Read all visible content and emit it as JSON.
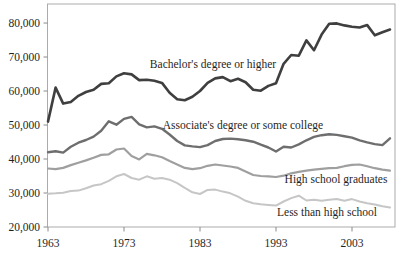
{
  "chart_data": {
    "type": "line",
    "title": "",
    "xlabel": "",
    "ylabel": "",
    "grid": false,
    "legend_position": "inline-labels",
    "x_start": 1963,
    "x_end": 2008,
    "x": [
      1963,
      1964,
      1965,
      1966,
      1967,
      1968,
      1969,
      1970,
      1971,
      1972,
      1973,
      1974,
      1975,
      1976,
      1977,
      1978,
      1979,
      1980,
      1981,
      1982,
      1983,
      1984,
      1985,
      1986,
      1987,
      1988,
      1989,
      1990,
      1991,
      1992,
      1993,
      1994,
      1995,
      1996,
      1997,
      1998,
      1999,
      2000,
      2001,
      2002,
      2003,
      2004,
      2005,
      2006,
      2007,
      2008
    ],
    "xticks": [
      {
        "v": 1963,
        "label": "1963"
      },
      {
        "v": 1973,
        "label": "1973"
      },
      {
        "v": 1983,
        "label": "1983"
      },
      {
        "v": 1993,
        "label": "1993"
      },
      {
        "v": 2003,
        "label": "2003"
      }
    ],
    "yticks": [
      {
        "v": 20000,
        "label": "20,000"
      },
      {
        "v": 30000,
        "label": "30,000"
      },
      {
        "v": 40000,
        "label": "40,000"
      },
      {
        "v": 50000,
        "label": "50,000"
      },
      {
        "v": 60000,
        "label": "60,000"
      },
      {
        "v": 70000,
        "label": "70,000"
      },
      {
        "v": 80000,
        "label": "80,000"
      }
    ],
    "ylim": [
      20000,
      85600
    ],
    "frame_color": "#ababab",
    "tick_color": "#8a8a8a",
    "text_color": "#1f1f1f",
    "series": [
      {
        "name": "Bachelor's degree or higher",
        "color": "#3f3f3f",
        "stroke_width": 2.6,
        "values": [
          51000,
          61000,
          56300,
          56800,
          58600,
          59700,
          60400,
          62100,
          62300,
          64300,
          65200,
          64900,
          63200,
          63300,
          63000,
          62400,
          59500,
          57600,
          57300,
          58300,
          60000,
          62400,
          63700,
          64100,
          62900,
          63600,
          62600,
          60400,
          60100,
          61500,
          62300,
          68000,
          70600,
          70400,
          74900,
          72000,
          76600,
          79800,
          79900,
          79300,
          78900,
          78700,
          79400,
          76400,
          77300,
          78100
        ]
      },
      {
        "name": "Associate's degree or some college",
        "color": "#6e6e6e",
        "stroke_width": 2.4,
        "values": [
          42000,
          42300,
          41900,
          43600,
          44800,
          45600,
          46600,
          48300,
          51100,
          50100,
          51800,
          52400,
          50200,
          49300,
          49600,
          48900,
          47200,
          45300,
          44000,
          43700,
          43500,
          44100,
          45300,
          45900,
          46000,
          45800,
          45500,
          45100,
          44200,
          43400,
          42200,
          43600,
          43400,
          44300,
          45500,
          46500,
          47000,
          47300,
          47100,
          46700,
          46300,
          45500,
          44900,
          44400,
          44100,
          46100
        ]
      },
      {
        "name": "High school graduates",
        "color": "#9f9f9f",
        "stroke_width": 2.2,
        "values": [
          37200,
          37000,
          37400,
          38200,
          38900,
          39600,
          40400,
          41200,
          41400,
          42800,
          43100,
          40900,
          39900,
          41500,
          41100,
          40500,
          39400,
          38400,
          37400,
          37000,
          37300,
          38000,
          38400,
          38100,
          37800,
          37400,
          36300,
          35300,
          35000,
          34900,
          34700,
          35100,
          35800,
          36200,
          36600,
          36900,
          37100,
          37300,
          37400,
          37900,
          38300,
          38400,
          37900,
          37300,
          36900,
          36600
        ]
      },
      {
        "name": "Less than high school",
        "color": "#c6c6c6",
        "stroke_width": 2.0,
        "values": [
          29800,
          29900,
          30100,
          30600,
          30700,
          31400,
          32200,
          32600,
          33600,
          34900,
          35600,
          34400,
          33900,
          34900,
          34200,
          34400,
          33900,
          32900,
          31500,
          30200,
          29700,
          30900,
          31000,
          30400,
          29900,
          28900,
          27700,
          27000,
          26700,
          26500,
          26300,
          27500,
          28500,
          29200,
          27800,
          28000,
          27700,
          28000,
          28200,
          27700,
          28200,
          27500,
          27000,
          26600,
          26100,
          25700
        ]
      }
    ],
    "annotations": [
      {
        "text": "Bachelor's degree or higher",
        "px": 213,
        "py": 68
      },
      {
        "text": "Associate's degree or some college",
        "px": 243,
        "py": 129
      },
      {
        "text": "High school graduates",
        "px": 336,
        "py": 183
      },
      {
        "text": "Less than high school",
        "px": 327,
        "py": 216
      }
    ]
  }
}
